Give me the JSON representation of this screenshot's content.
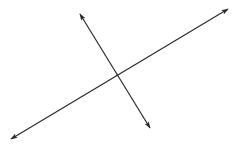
{
  "diagram": {
    "type": "intersecting-lines",
    "line_color": "#2a2a2a",
    "background": "#ffffff",
    "lines": [
      {
        "name": "line-a",
        "arrows": "both"
      },
      {
        "name": "line-b",
        "arrows": "both"
      }
    ],
    "labels": []
  }
}
